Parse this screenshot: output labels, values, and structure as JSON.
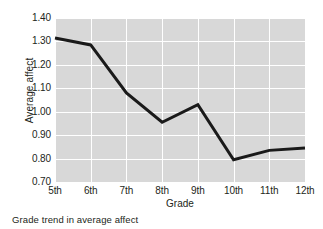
{
  "caption": "Grade trend in average affect",
  "chart_data": {
    "type": "line",
    "title": "",
    "xlabel": "Grade",
    "ylabel": "Average affect",
    "categories": [
      "5th",
      "6th",
      "7th",
      "8th",
      "9th",
      "10th",
      "11th",
      "12th"
    ],
    "values": [
      1.315,
      1.285,
      1.08,
      0.955,
      1.03,
      0.795,
      0.835,
      0.845
    ],
    "series": [
      {
        "name": "Average affect",
        "values": [
          1.315,
          1.285,
          1.08,
          0.955,
          1.03,
          0.795,
          0.835,
          0.845
        ]
      }
    ],
    "ylim": [
      0.7,
      1.4
    ],
    "yticks": [
      "0.70",
      "0.80",
      "0.90",
      "1.00",
      "1.10",
      "1.20",
      "1.30",
      "1.40"
    ],
    "ytick_values": [
      0.7,
      0.8,
      0.9,
      1.0,
      1.1,
      1.2,
      1.3,
      1.4
    ],
    "grid": true,
    "legend": "none",
    "line_color": "#1a1a1a",
    "plot_background": "#d8d8d8",
    "grid_color": "#ffffff",
    "figure_background": "#ffffff"
  }
}
